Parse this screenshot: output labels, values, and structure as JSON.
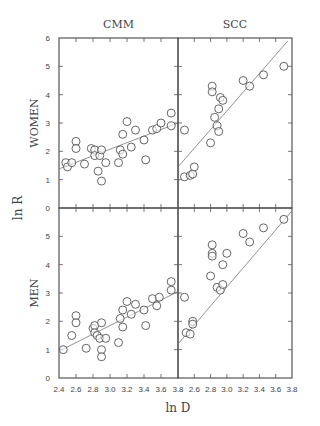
{
  "chart_data": {
    "type": "scatter",
    "column_titles": [
      "CMM",
      "SCC"
    ],
    "row_labels": [
      "WOMEN",
      "MEN"
    ],
    "xlabel": "ln D",
    "ylabel": "ln R",
    "x_ticks": [
      "2.4",
      "2.6",
      "2.8",
      "3.0",
      "3.2",
      "3.4",
      "3.6",
      "3.8"
    ],
    "x_ticks_right": [
      "2.6",
      "2.8",
      "3.0",
      "3.2",
      "3.4",
      "3.6",
      "3.8"
    ],
    "y_ticks_top": [
      "0",
      "1",
      "2",
      "3",
      "4",
      "5",
      "6"
    ],
    "y_ticks_bottom": [
      "1",
      "2",
      "3",
      "4",
      "5"
    ],
    "xlim": [
      2.4,
      3.8
    ],
    "ylim": [
      0,
      6
    ],
    "panels": [
      {
        "name": "WOMEN-CMM",
        "fit_line": [
          [
            2.4,
            1.38
          ],
          [
            3.8,
            3.0
          ]
        ],
        "points": [
          [
            2.48,
            1.6
          ],
          [
            2.5,
            1.45
          ],
          [
            2.55,
            1.6
          ],
          [
            2.6,
            2.35
          ],
          [
            2.6,
            2.1
          ],
          [
            2.7,
            1.55
          ],
          [
            2.78,
            2.1
          ],
          [
            2.82,
            2.05
          ],
          [
            2.82,
            1.85
          ],
          [
            2.88,
            1.85
          ],
          [
            2.86,
            1.3
          ],
          [
            2.9,
            2.05
          ],
          [
            2.9,
            0.95
          ],
          [
            2.95,
            1.6
          ],
          [
            3.1,
            1.6
          ],
          [
            3.12,
            2.05
          ],
          [
            3.15,
            1.9
          ],
          [
            3.15,
            2.6
          ],
          [
            3.2,
            3.05
          ],
          [
            3.25,
            2.15
          ],
          [
            3.3,
            2.75
          ],
          [
            3.4,
            2.4
          ],
          [
            3.42,
            1.7
          ],
          [
            3.5,
            2.75
          ],
          [
            3.55,
            2.8
          ],
          [
            3.6,
            3.0
          ],
          [
            3.72,
            3.35
          ],
          [
            3.72,
            2.9
          ]
        ]
      },
      {
        "name": "WOMEN-SCC",
        "fit_line": [
          [
            2.4,
            1.45
          ],
          [
            3.75,
            5.9
          ]
        ],
        "points": [
          [
            2.48,
            2.75
          ],
          [
            2.48,
            1.1
          ],
          [
            2.55,
            1.15
          ],
          [
            2.58,
            1.2
          ],
          [
            2.6,
            1.45
          ],
          [
            2.8,
            2.3
          ],
          [
            2.82,
            4.3
          ],
          [
            2.82,
            4.1
          ],
          [
            2.85,
            3.2
          ],
          [
            2.88,
            2.9
          ],
          [
            2.9,
            2.7
          ],
          [
            2.9,
            3.5
          ],
          [
            2.92,
            3.9
          ],
          [
            2.95,
            3.8
          ],
          [
            3.2,
            4.5
          ],
          [
            3.28,
            4.3
          ],
          [
            3.45,
            4.7
          ],
          [
            3.7,
            5.0
          ]
        ]
      },
      {
        "name": "MEN-CMM",
        "fit_line": [
          [
            2.4,
            0.95
          ],
          [
            3.8,
            3.05
          ]
        ],
        "points": [
          [
            2.45,
            1.0
          ],
          [
            2.55,
            1.5
          ],
          [
            2.6,
            2.2
          ],
          [
            2.6,
            1.95
          ],
          [
            2.72,
            1.05
          ],
          [
            2.8,
            1.75
          ],
          [
            2.82,
            1.85
          ],
          [
            2.82,
            1.6
          ],
          [
            2.85,
            1.5
          ],
          [
            2.88,
            1.4
          ],
          [
            2.9,
            1.95
          ],
          [
            2.9,
            1.0
          ],
          [
            2.9,
            0.75
          ],
          [
            2.95,
            1.4
          ],
          [
            3.1,
            1.25
          ],
          [
            3.12,
            2.1
          ],
          [
            3.15,
            1.8
          ],
          [
            3.15,
            2.4
          ],
          [
            3.2,
            2.7
          ],
          [
            3.25,
            2.25
          ],
          [
            3.3,
            2.6
          ],
          [
            3.4,
            2.4
          ],
          [
            3.42,
            1.85
          ],
          [
            3.5,
            2.8
          ],
          [
            3.55,
            2.55
          ],
          [
            3.58,
            2.85
          ],
          [
            3.72,
            3.4
          ],
          [
            3.72,
            3.1
          ]
        ]
      },
      {
        "name": "MEN-SCC",
        "fit_line": [
          [
            2.4,
            1.2
          ],
          [
            3.8,
            5.9
          ]
        ],
        "points": [
          [
            2.48,
            2.85
          ],
          [
            2.5,
            1.6
          ],
          [
            2.55,
            1.55
          ],
          [
            2.58,
            2.0
          ],
          [
            2.58,
            1.9
          ],
          [
            2.8,
            3.6
          ],
          [
            2.82,
            4.4
          ],
          [
            2.82,
            4.3
          ],
          [
            2.82,
            4.7
          ],
          [
            2.88,
            3.2
          ],
          [
            2.92,
            3.1
          ],
          [
            2.95,
            4.0
          ],
          [
            2.95,
            3.3
          ],
          [
            3.0,
            4.4
          ],
          [
            3.2,
            5.1
          ],
          [
            3.28,
            4.8
          ],
          [
            3.45,
            5.3
          ],
          [
            3.7,
            5.6
          ]
        ]
      }
    ]
  }
}
